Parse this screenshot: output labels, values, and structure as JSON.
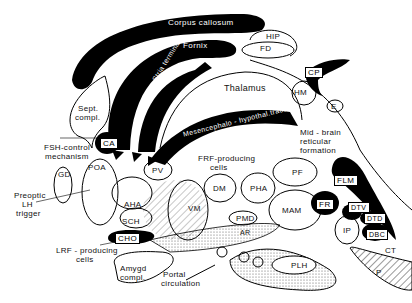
{
  "diagram": {
    "type": "neuroanatomy-sagittal-section",
    "colors": {
      "ink": "#000000",
      "paper": "#ffffff",
      "stipple": "#bbbbbb"
    },
    "tracts": {
      "corpus_callosum": "Corpus callosum",
      "fornix": "Fornix",
      "stria_terminalis": "Stria terminalis",
      "mesencephalo": "Mesencephalo - hypothal.tract"
    },
    "regions": {
      "hip": "HIP",
      "fd": "FD",
      "cp": "CP",
      "hm": "HM",
      "e": "E",
      "thalamus": "Thalamus",
      "sept_1": "Sept.",
      "sept_2": "compl.",
      "ca": "CA",
      "mid_1": "Mid - brain",
      "mid_2": "reticular",
      "mid_3": "formation",
      "fsh_1": "FSH-control",
      "fsh_2": "mechanism",
      "frf_1": "FRF-producing",
      "frf_2": "cells",
      "gd": "GD",
      "poa": "POA",
      "pv": "PV",
      "aha": "AHA",
      "preoptic_1": "Preoptic",
      "preoptic_2": "LH",
      "preoptic_3": "trigger",
      "sch": "SCH",
      "cho": "CHO",
      "dm": "DM",
      "pha": "PHA",
      "pf": "PF",
      "vm": "VM",
      "pmd": "PMD",
      "mam": "MAM",
      "flm": "FLM",
      "fr": "FR",
      "dtv": "DTV",
      "dtd": "DTD",
      "ip": "IP",
      "dbc": "DBC",
      "ar": "AR",
      "lrf_1": "LRF - producing",
      "lrf_2": "cells",
      "amygd_1": "Amygd",
      "amygd_2": "compl.",
      "portal_1": "Portal",
      "portal_2": "circulation",
      "plh": "PLH",
      "ct": "CT",
      "p": "P"
    }
  }
}
